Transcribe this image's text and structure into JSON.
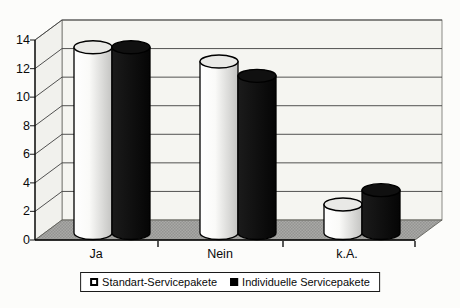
{
  "chart_data": {
    "type": "bar",
    "variant": "3d-cylinder-clustered",
    "title": "",
    "xlabel": "",
    "ylabel": "",
    "categories": [
      "Ja",
      "Nein",
      "k.A."
    ],
    "series": [
      {
        "name": "Standart-Servicepakete",
        "color": "#ffffff",
        "values": [
          13,
          12,
          2
        ]
      },
      {
        "name": "Individuelle Servicepakete",
        "color": "#000000",
        "values": [
          13,
          11,
          3
        ]
      }
    ],
    "ylim": [
      0,
      14
    ],
    "ytick_step": 2,
    "yticks": [
      0,
      2,
      4,
      6,
      8,
      10,
      12,
      14
    ],
    "grid": true,
    "legend_position": "bottom",
    "colors": {
      "wall": "#f5f5f1",
      "side_wall": "#f1f1ed",
      "floor": "#a6a6a4",
      "gridline": "#3f3f3f",
      "axis": "#000000",
      "background": "#fcfcfa"
    }
  }
}
